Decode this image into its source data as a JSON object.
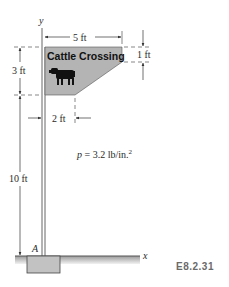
{
  "figure": {
    "id_label": "E8.2.31",
    "axes": {
      "x_label": "x",
      "y_label": "y",
      "origin_label": "A"
    },
    "sign": {
      "text": "Cattle Crossing",
      "icon": "cow-icon",
      "fill_color": "#b4b4b4"
    },
    "dimensions": {
      "sign_width": "5 ft",
      "right_edge_height": "1 ft",
      "sign_height": "3 ft",
      "bottom_edge_width": "2 ft",
      "post_height": "10 ft"
    },
    "pressure": {
      "symbol": "p",
      "equals": " = 3.2 lb/in.",
      "exponent": "2"
    }
  }
}
